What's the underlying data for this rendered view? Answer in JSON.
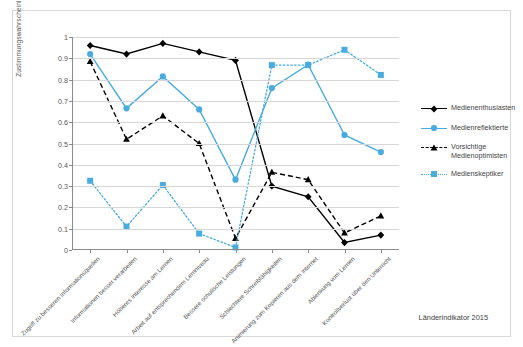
{
  "chart_data": {
    "type": "line",
    "title": "",
    "xlabel": "",
    "ylabel": "Zustimmungswahrscheinlichkeiten",
    "ylim": [
      0,
      1
    ],
    "yticks": [
      "0",
      "0.1",
      "0.2",
      "0.3",
      "0.4",
      "0.5",
      "0.6",
      "0.7",
      "0.8",
      "0.9",
      "1"
    ],
    "grid": true,
    "legend_position": "right",
    "categories": [
      "Zugriff zu besseren Informationsquellen",
      "Informationen besser verarbeiten",
      "Höheres Interesse am Lernen",
      "Arbeit auf entsprechendem Lernniveau",
      "Bessere schulische Leistungen",
      "Schlechtere Schreibfähigkeiten",
      "Animierung zum Kopieren aus dem Internet",
      "Ablenkung vom Lernen",
      "Kontrollverlust über den Unterricht"
    ],
    "series": [
      {
        "name": "Medienenthusiasten",
        "color": "#000000",
        "style": "solid",
        "marker": "diamond",
        "values": [
          0.96,
          0.92,
          0.97,
          0.93,
          0.89,
          0.3,
          0.25,
          0.035,
          0.07
        ]
      },
      {
        "name": "Medienreflektierte",
        "color": "#49ABDE",
        "style": "solid",
        "marker": "circle",
        "values": [
          0.92,
          0.665,
          0.815,
          0.66,
          0.33,
          0.76,
          0.87,
          0.54,
          0.46
        ]
      },
      {
        "name": "Vorsichtige Medienoptimisten",
        "color": "#000000",
        "style": "dashed",
        "marker": "triangle",
        "values": [
          0.885,
          0.52,
          0.63,
          0.5,
          0.055,
          0.365,
          0.33,
          0.08,
          0.16
        ]
      },
      {
        "name": "Medienskeptiker",
        "color": "#49ABDE",
        "style": "dotted",
        "marker": "square",
        "values": [
          0.325,
          0.11,
          0.305,
          0.077,
          0.012,
          0.868,
          0.868,
          0.94,
          0.822
        ]
      }
    ]
  },
  "legend": {
    "entries": [
      {
        "label": "Medienenthusiasten"
      },
      {
        "label": "Medienreflektierte"
      },
      {
        "label": "Vorsichtige Medienoptimisten"
      },
      {
        "label": "Medienskeptiker"
      }
    ]
  },
  "source_note": "Länderindikator 2015"
}
